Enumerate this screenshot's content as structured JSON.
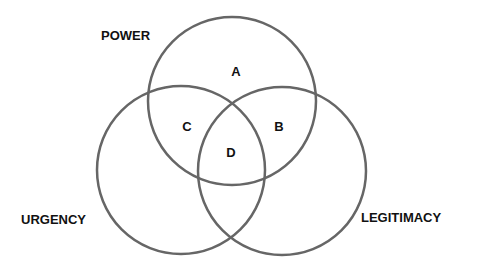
{
  "diagram": {
    "type": "venn",
    "stroke_color": "#666666",
    "sets": [
      {
        "id": "power",
        "label": "POWER",
        "cx": 232,
        "cy": 101,
        "r": 84
      },
      {
        "id": "urgency",
        "label": "URGENCY",
        "cx": 181,
        "cy": 170,
        "r": 84
      },
      {
        "id": "legitimacy",
        "label": "LEGITIMACY",
        "cx": 282,
        "cy": 171,
        "r": 84
      }
    ],
    "regions": [
      {
        "label": "A"
      },
      {
        "label": "B"
      },
      {
        "label": "C"
      },
      {
        "label": "D"
      }
    ]
  }
}
